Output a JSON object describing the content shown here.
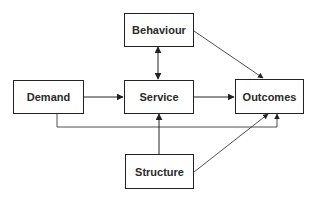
{
  "diagram": {
    "type": "flow-diagram",
    "nodes": [
      {
        "id": "behaviour",
        "label": "Behaviour"
      },
      {
        "id": "demand",
        "label": "Demand"
      },
      {
        "id": "service",
        "label": "Service"
      },
      {
        "id": "outcomes",
        "label": "Outcomes"
      },
      {
        "id": "structure",
        "label": "Structure"
      }
    ],
    "edges": [
      {
        "from": "behaviour",
        "to": "service",
        "bidirectional": true
      },
      {
        "from": "behaviour",
        "to": "outcomes"
      },
      {
        "from": "demand",
        "to": "service"
      },
      {
        "from": "service",
        "to": "outcomes"
      },
      {
        "from": "demand",
        "to": "outcomes",
        "routing": "orthogonal-below"
      },
      {
        "from": "structure",
        "to": "service"
      },
      {
        "from": "structure",
        "to": "outcomes"
      }
    ],
    "colors": {
      "stroke": "#222222",
      "text": "#2a2a2a",
      "background": "#ffffff"
    }
  }
}
